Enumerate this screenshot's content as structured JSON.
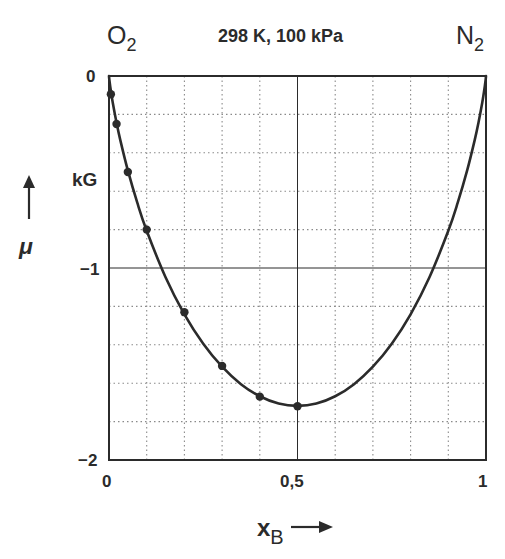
{
  "header": {
    "left_species": {
      "base": "O",
      "sub": "2"
    },
    "conditions": "298 K, 100 kPa",
    "right_species": {
      "base": "N",
      "sub": "2"
    }
  },
  "axes": {
    "y": {
      "symbol": "μ",
      "unit": "kG",
      "ticks": [
        {
          "value": 0,
          "label": "0"
        },
        {
          "value": -1,
          "label": "−1"
        },
        {
          "value": -2,
          "label": "−2"
        }
      ]
    },
    "x": {
      "symbol": "x",
      "sub": "B",
      "ticks": [
        {
          "value": 0,
          "label": "0"
        },
        {
          "value": 0.5,
          "label": "0,5"
        },
        {
          "value": 1,
          "label": "1"
        }
      ]
    }
  },
  "colors": {
    "line": "#2b2b2b",
    "grid": "#8a8a8a",
    "frame": "#2b2b2b",
    "text": "#2b2b2b",
    "background": "#ffffff"
  },
  "chart_data": {
    "type": "line",
    "title": "298 K, 100 kPa",
    "xlabel": "x_B",
    "ylabel": "μ (kG)",
    "left_endpoint_label": "O2",
    "right_endpoint_label": "N2",
    "xlim": [
      0,
      1
    ],
    "ylim": [
      -2,
      0
    ],
    "grid": {
      "x_step": 0.1,
      "y_step": 0.2,
      "style": "dotted",
      "solid_at": {
        "x": [
          0.5
        ],
        "y": [
          -1
        ]
      }
    },
    "x_ticks": [
      0,
      0.5,
      1
    ],
    "y_ticks": [
      0,
      -1,
      -2
    ],
    "legend": null,
    "series": [
      {
        "name": "mixing curve",
        "kind": "line",
        "points": [
          [
            0,
            0
          ],
          [
            0.001,
            -0.02
          ],
          [
            0.005,
            -0.078
          ],
          [
            0.01,
            -0.139
          ],
          [
            0.02,
            -0.243
          ],
          [
            0.03,
            -0.334
          ],
          [
            0.05,
            -0.492
          ],
          [
            0.075,
            -0.66
          ],
          [
            0.1,
            -0.806
          ],
          [
            0.15,
            -1.048
          ],
          [
            0.2,
            -1.241
          ],
          [
            0.25,
            -1.394
          ],
          [
            0.3,
            -1.514
          ],
          [
            0.35,
            -1.605
          ],
          [
            0.4,
            -1.668
          ],
          [
            0.45,
            -1.706
          ],
          [
            0.5,
            -1.718
          ],
          [
            0.55,
            -1.706
          ],
          [
            0.6,
            -1.668
          ],
          [
            0.65,
            -1.605
          ],
          [
            0.7,
            -1.514
          ],
          [
            0.75,
            -1.394
          ],
          [
            0.8,
            -1.241
          ],
          [
            0.85,
            -1.048
          ],
          [
            0.9,
            -0.806
          ],
          [
            0.925,
            -0.66
          ],
          [
            0.95,
            -0.492
          ],
          [
            0.97,
            -0.334
          ],
          [
            0.98,
            -0.243
          ],
          [
            0.99,
            -0.139
          ],
          [
            0.995,
            -0.078
          ],
          [
            0.999,
            -0.02
          ],
          [
            1,
            0
          ]
        ]
      },
      {
        "name": "data points",
        "kind": "scatter",
        "points": [
          [
            0.005,
            -0.095
          ],
          [
            0.02,
            -0.25
          ],
          [
            0.05,
            -0.5
          ],
          [
            0.1,
            -0.8
          ],
          [
            0.2,
            -1.23
          ],
          [
            0.3,
            -1.51
          ],
          [
            0.4,
            -1.67
          ],
          [
            0.5,
            -1.72
          ]
        ]
      }
    ]
  },
  "layout": {
    "plot": {
      "left": 109,
      "top": 76,
      "width": 377,
      "height": 384
    }
  }
}
